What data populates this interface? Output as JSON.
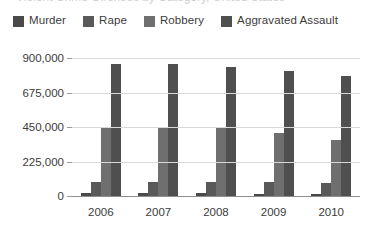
{
  "title_partial": "Violent Crime Offenses by Category, United States",
  "legend": {
    "items": [
      {
        "label": "Murder",
        "color": "#4a4a4a"
      },
      {
        "label": "Rape",
        "color": "#595959"
      },
      {
        "label": "Robbery",
        "color": "#6f6f6f"
      },
      {
        "label": "Aggravated Assault",
        "color": "#4f4f4f"
      }
    ]
  },
  "chart_data": {
    "type": "bar",
    "title": "",
    "xlabel": "",
    "ylabel": "",
    "categories": [
      "2006",
      "2007",
      "2008",
      "2009",
      "2010"
    ],
    "ytick_labels": [
      "0",
      "225,000",
      "450,000",
      "675,000",
      "900,000"
    ],
    "ytick_values": [
      0,
      225000,
      450000,
      675000,
      900000
    ],
    "ylim": [
      0,
      900000
    ],
    "grid": true,
    "legend_position": "top",
    "series": [
      {
        "name": "Murder",
        "color": "#4a4a4a",
        "values": [
          17030,
          16929,
          16442,
          15399,
          14748
        ]
      },
      {
        "name": "Rape",
        "color": "#595959",
        "values": [
          92760,
          90427,
          90479,
          89241,
          84767
        ]
      },
      {
        "name": "Robbery",
        "color": "#6f6f6f",
        "values": [
          449246,
          447324,
          443574,
          408742,
          367832
        ]
      },
      {
        "name": "Aggravated Assault",
        "color": "#4f4f4f",
        "values": [
          860853,
          861090,
          843683,
          812514,
          781844
        ]
      }
    ]
  }
}
